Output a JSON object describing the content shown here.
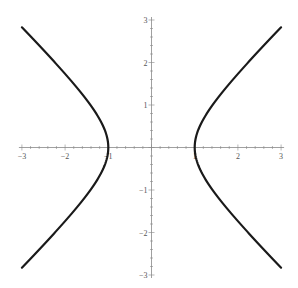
{
  "chart_data": {
    "type": "line",
    "title": "",
    "xlabel": "",
    "ylabel": "",
    "equation": "x^2 - y^2 = 1",
    "xlim": [
      -3,
      3
    ],
    "ylim": [
      -3,
      3
    ],
    "grid": false,
    "axes_style": "centered at origin",
    "x_ticks": [
      -3,
      -2,
      -1,
      1,
      2,
      3
    ],
    "x_tick_labels": [
      "-3",
      "-2",
      "-1",
      "1",
      "2",
      "3"
    ],
    "y_ticks": [
      -3,
      -2,
      -1,
      1,
      2,
      3
    ],
    "y_tick_labels": [
      "-3",
      "-2",
      "-1",
      "1",
      "2",
      "3"
    ],
    "minor_tick_step": 0.2,
    "series": [
      {
        "name": "right-branch",
        "color": "#1a1a1a",
        "points": [
          [
            3,
            -2.828
          ],
          [
            2.5,
            -2.291
          ],
          [
            2,
            -1.732
          ],
          [
            1.5,
            -1.118
          ],
          [
            1.2,
            -0.663
          ],
          [
            1.05,
            -0.32
          ],
          [
            1,
            0
          ],
          [
            1.05,
            0.32
          ],
          [
            1.2,
            0.663
          ],
          [
            1.5,
            1.118
          ],
          [
            2,
            1.732
          ],
          [
            2.5,
            2.291
          ],
          [
            3,
            2.828
          ]
        ]
      },
      {
        "name": "left-branch",
        "color": "#1a1a1a",
        "points": [
          [
            -3,
            -2.828
          ],
          [
            -2.5,
            -2.291
          ],
          [
            -2,
            -1.732
          ],
          [
            -1.5,
            -1.118
          ],
          [
            -1.2,
            -0.663
          ],
          [
            -1.05,
            -0.32
          ],
          [
            -1,
            0
          ],
          [
            -1.05,
            0.32
          ],
          [
            -1.2,
            0.663
          ],
          [
            -1.5,
            1.118
          ],
          [
            -2,
            1.732
          ],
          [
            -2.5,
            2.291
          ],
          [
            -3,
            2.828
          ]
        ]
      }
    ],
    "colors": {
      "axis": "#888888",
      "curve": "#1a1a1a",
      "label": "#555555"
    }
  }
}
